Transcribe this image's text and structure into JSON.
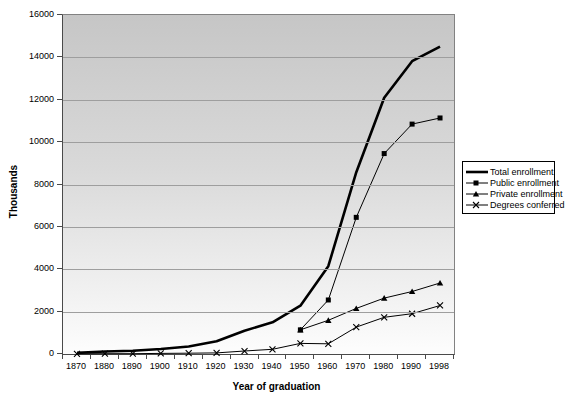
{
  "chart_data": {
    "type": "line",
    "title": "",
    "xlabel": "Year of graduation",
    "ylabel": "Thousands",
    "categories": [
      "1870",
      "1880",
      "1890",
      "1900",
      "1910",
      "1920",
      "1930",
      "1940",
      "1950",
      "1960",
      "1970",
      "1980",
      "1990",
      "1998"
    ],
    "series": [
      {
        "name": "Total enrollment",
        "marker": "none",
        "line_width": 2.6,
        "values": [
          52,
          116,
          157,
          238,
          355,
          598,
          1100,
          1494,
          2281,
          4145,
          8581,
          12097,
          13819,
          14507
        ]
      },
      {
        "name": "Public enrollment",
        "marker": "square",
        "line_width": 1,
        "values": [
          null,
          null,
          null,
          null,
          null,
          null,
          null,
          null,
          1140,
          2550,
          6450,
          9460,
          10850,
          11140
        ]
      },
      {
        "name": "Private enrollment",
        "marker": "triangle",
        "line_width": 1,
        "values": [
          null,
          null,
          null,
          null,
          null,
          null,
          null,
          null,
          1140,
          1590,
          2150,
          2640,
          2950,
          3350
        ]
      },
      {
        "name": "Degrees conferred",
        "marker": "x",
        "line_width": 1,
        "values": [
          10,
          13,
          16,
          29,
          40,
          53,
          140,
          220,
          500,
          480,
          1270,
          1730,
          1900,
          2290
        ]
      }
    ],
    "ylim": [
      0,
      16000
    ],
    "y_tick_step": 2000,
    "y_ticks": [
      0,
      2000,
      4000,
      6000,
      8000,
      10000,
      12000,
      14000,
      16000
    ],
    "grid": true,
    "legend_position": "right",
    "colors": {
      "series_line": "#000000",
      "grid": "#9e9e9e",
      "plot_border": "#828282",
      "axis": "#4a4a4a",
      "plot_bg_top": "#c6c6c6",
      "plot_bg_bottom": "#fdfdfd",
      "page_bg": "#ffffff"
    }
  }
}
